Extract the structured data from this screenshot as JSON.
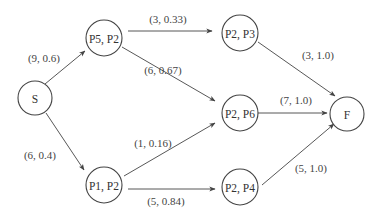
{
  "diagram": {
    "nodes": {
      "s": {
        "label": "S",
        "cx": 35,
        "cy": 98,
        "r": 17
      },
      "p5p2": {
        "label": "P5, P2",
        "cx": 104,
        "cy": 38,
        "r": 18
      },
      "p2p3": {
        "label": "P2, P3",
        "cx": 240,
        "cy": 34,
        "r": 18
      },
      "p2p6": {
        "label": "P2, P6",
        "cx": 240,
        "cy": 114,
        "r": 18
      },
      "f": {
        "label": "F",
        "cx": 347,
        "cy": 114,
        "r": 17
      },
      "p1p2": {
        "label": "P1, P2",
        "cx": 104,
        "cy": 184,
        "r": 18
      },
      "p2p4": {
        "label": "P2, P4",
        "cx": 240,
        "cy": 184,
        "r": 18
      }
    },
    "edges": {
      "s_p5p2": {
        "label": "(9, 0.6)",
        "from": "S",
        "to": "P5, P2"
      },
      "s_p1p2": {
        "label": "(6, 0.4)",
        "from": "S",
        "to": "P1, P2"
      },
      "p5p2_p2p3": {
        "label": "(3, 0.33)",
        "from": "P5, P2",
        "to": "P2, P3"
      },
      "p5p2_p2p6": {
        "label": "(6, 0.67)",
        "from": "P5, P2",
        "to": "P2, P6"
      },
      "p1p2_p2p6": {
        "label": "(1, 0.16)",
        "from": "P1, P2",
        "to": "P2, P6"
      },
      "p1p2_p2p4": {
        "label": "(5, 0.84)",
        "from": "P1, P2",
        "to": "P2, P4"
      },
      "p2p3_f": {
        "label": "(3, 1.0)",
        "from": "P2, P3",
        "to": "F"
      },
      "p2p6_f": {
        "label": "(7, 1.0)",
        "from": "P2, P6",
        "to": "F"
      },
      "p2p4_f": {
        "label": "(5, 1.0)",
        "from": "P2, P4",
        "to": "F"
      }
    },
    "colors": {
      "stroke": "#444444",
      "text": "#333333",
      "background": "#ffffff"
    }
  }
}
